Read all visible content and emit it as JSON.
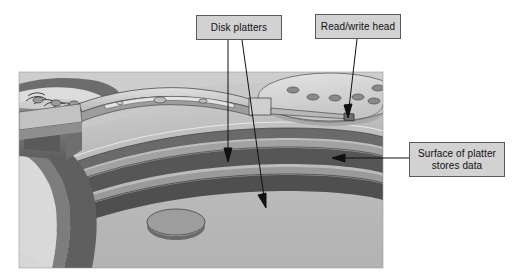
{
  "figure": {
    "background_color": "#ffffff",
    "photo_area": {
      "x": 19,
      "y": 72,
      "width": 364,
      "height": 196,
      "base_color": "#b9b9b9"
    }
  },
  "callouts": [
    {
      "id": "disk-platters",
      "label": "Disk platters",
      "box": {
        "x": 196,
        "y": 15,
        "width": 86,
        "height": 25
      },
      "fill": "#d2d2d2",
      "border": "#5a5a5a",
      "leaders": [
        {
          "from": [
            228,
            40
          ],
          "to": [
            228,
            160
          ]
        },
        {
          "from": [
            242,
            40
          ],
          "to": [
            266,
            207
          ]
        }
      ]
    },
    {
      "id": "read-write-head",
      "label": "Read/write head",
      "box": {
        "x": 315,
        "y": 14,
        "width": 86,
        "height": 25
      },
      "fill": "#d2d2d2",
      "border": "#5a5a5a",
      "leaders": [
        {
          "from": [
            357,
            39
          ],
          "to": [
            348,
            117
          ]
        }
      ]
    },
    {
      "id": "surface-of-platter",
      "label_line1": "Surface of platter",
      "label_line2": "stores data",
      "box": {
        "x": 409,
        "y": 142,
        "width": 96,
        "height": 35
      },
      "fill": "#d2d2d2",
      "border": "#5a5a5a",
      "leaders": [
        {
          "from": [
            409,
            158
          ],
          "to": [
            333,
            158
          ]
        }
      ]
    }
  ],
  "components": {
    "platter_stack_label": "stacked disk platters",
    "spindle_hub_label": "spindle hub with mounting holes",
    "actuator_arm_label": "actuator arm assembly",
    "head_slider_label": "read/write head slider",
    "voice_coil_label": "voice coil motor",
    "chassis_label": "drive chassis casting"
  },
  "palette": {
    "callout_fill": "#d2d2d2",
    "callout_border": "#5a5a5a",
    "leader_line": "#1a1a1a",
    "platter_top": "#c3c3c3",
    "platter_edge_dark": "#5c5c5c",
    "platter_edge_mid": "#8d8d8d",
    "chassis_dark": "#4a4a4a",
    "chassis_mid": "#7a7a7a",
    "arm_light": "#cfcfcf",
    "background": "#ffffff"
  }
}
